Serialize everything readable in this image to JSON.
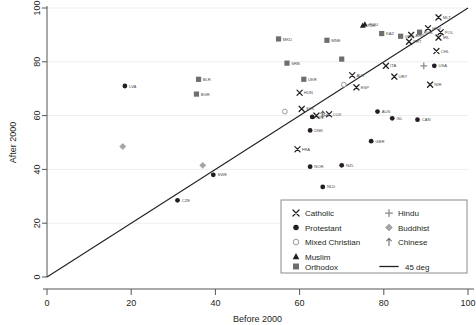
{
  "chart_data": {
    "type": "scatter",
    "title": "",
    "xlabel": "Before 2000",
    "ylabel": "After 2000",
    "xlim": [
      0,
      100
    ],
    "ylim": [
      0,
      100
    ],
    "xticks": [
      0,
      20,
      40,
      60,
      80,
      100
    ],
    "yticks": [
      0,
      20,
      40,
      60,
      80,
      100
    ],
    "grid": true,
    "grid_axis": "y",
    "legend_position": "bottom-right",
    "legend": [
      {
        "key": "catholic",
        "label": "Catholic",
        "marker": "x",
        "color": "#231f20"
      },
      {
        "key": "protestant",
        "label": "Protestant",
        "marker": "filled-circle",
        "color": "#231f20"
      },
      {
        "key": "mixed",
        "label": "Mixed Christian",
        "marker": "open-circle",
        "color": "#999999"
      },
      {
        "key": "muslim",
        "label": "Muslim",
        "marker": "triangle",
        "color": "#231f20"
      },
      {
        "key": "orthodox",
        "label": "Orthodox",
        "marker": "square",
        "color": "#6e6e6e"
      },
      {
        "key": "hindu",
        "label": "Hindu",
        "marker": "plus",
        "color": "#8a8a8a"
      },
      {
        "key": "buddhist",
        "label": "Buddhist",
        "marker": "diamond",
        "color": "#a6a6a6"
      },
      {
        "key": "chinese",
        "label": "Chinese",
        "marker": "arrow-up",
        "color": "#6e6e6e"
      },
      {
        "key": "45deg",
        "label": "45 deg",
        "marker": "line",
        "color": "#231f20"
      }
    ],
    "reference_line": {
      "label": "45 deg",
      "from": [
        0,
        0
      ],
      "to": [
        100,
        100
      ],
      "color": "#231f20"
    },
    "points": [
      {
        "label": "LVA",
        "x": 18.5,
        "y": 71.0,
        "group": "protestant"
      },
      {
        "label": "BLR",
        "x": 36.0,
        "y": 73.5,
        "group": "orthodox"
      },
      {
        "label": "BGR",
        "x": 35.5,
        "y": 68.0,
        "group": "orthodox"
      },
      {
        "label": "",
        "x": 18.0,
        "y": 48.5,
        "group": "buddhist"
      },
      {
        "label": "",
        "x": 37.0,
        "y": 41.5,
        "group": "buddhist"
      },
      {
        "label": "CZE",
        "x": 31.0,
        "y": 28.5,
        "group": "protestant"
      },
      {
        "label": "SWE",
        "x": 39.5,
        "y": 38.0,
        "group": "protestant"
      },
      {
        "label": "MKD",
        "x": 55.0,
        "y": 88.5,
        "group": "orthodox"
      },
      {
        "label": "SRB",
        "x": 57.0,
        "y": 79.5,
        "group": "orthodox"
      },
      {
        "label": "UKR",
        "x": 61.0,
        "y": 73.5,
        "group": "orthodox"
      },
      {
        "label": "MNE",
        "x": 66.5,
        "y": 88.0,
        "group": "orthodox"
      },
      {
        "label": "",
        "x": 70.0,
        "y": 81.0,
        "group": "orthodox"
      },
      {
        "label": "ROU",
        "x": 75.5,
        "y": 94.0,
        "group": "muslim"
      },
      {
        "label": "TUR",
        "x": 75.0,
        "y": 93.5,
        "group": "muslim"
      },
      {
        "label": "KAZ",
        "x": 79.5,
        "y": 90.5,
        "group": "orthodox"
      },
      {
        "label": "GRC",
        "x": 84.0,
        "y": 89.5,
        "group": "orthodox"
      },
      {
        "label": "RUS",
        "x": 88.5,
        "y": 91.0,
        "group": "orthodox"
      },
      {
        "label": "HRV",
        "x": 90.5,
        "y": 92.5,
        "group": "catholic"
      },
      {
        "label": "MLT",
        "x": 93.0,
        "y": 96.5,
        "group": "catholic"
      },
      {
        "label": "IRL",
        "x": 93.0,
        "y": 89.0,
        "group": "catholic"
      },
      {
        "label": "POL",
        "x": 93.5,
        "y": 91.0,
        "group": "catholic"
      },
      {
        "label": "CHL",
        "x": 92.5,
        "y": 84.0,
        "group": "catholic"
      },
      {
        "label": "USA",
        "x": 92.0,
        "y": 78.5,
        "group": "protestant"
      },
      {
        "label": "",
        "x": 89.5,
        "y": 78.5,
        "group": "hindu"
      },
      {
        "label": "PRT",
        "x": 86.0,
        "y": 87.5,
        "group": "catholic"
      },
      {
        "label": "ARG",
        "x": 86.5,
        "y": 90.0,
        "group": "catholic"
      },
      {
        "label": "NIR",
        "x": 91.0,
        "y": 71.5,
        "group": "catholic"
      },
      {
        "label": "ITA",
        "x": 80.5,
        "y": 78.5,
        "group": "catholic"
      },
      {
        "label": "URY",
        "x": 82.5,
        "y": 74.5,
        "group": "catholic"
      },
      {
        "label": "CAN",
        "x": 88.0,
        "y": 58.5,
        "group": "protestant"
      },
      {
        "label": "ISL",
        "x": 82.0,
        "y": 59.0,
        "group": "protestant"
      },
      {
        "label": "AUS",
        "x": 78.5,
        "y": 61.5,
        "group": "protestant"
      },
      {
        "label": "GBR",
        "x": 77.0,
        "y": 50.5,
        "group": "protestant"
      },
      {
        "label": "ESP",
        "x": 73.5,
        "y": 70.5,
        "group": "catholic"
      },
      {
        "label": "AUT",
        "x": 72.5,
        "y": 75.0,
        "group": "catholic"
      },
      {
        "label": "",
        "x": 70.5,
        "y": 71.5,
        "group": "mixed"
      },
      {
        "label": "LUX",
        "x": 67.0,
        "y": 60.5,
        "group": "catholic"
      },
      {
        "label": "",
        "x": 65.5,
        "y": 60.5,
        "group": "chinese"
      },
      {
        "label": "CHE",
        "x": 64.0,
        "y": 60.0,
        "group": "catholic"
      },
      {
        "label": "FIN",
        "x": 63.0,
        "y": 59.5,
        "group": "protestant"
      },
      {
        "label": "DNK",
        "x": 62.5,
        "y": 54.5,
        "group": "protestant"
      },
      {
        "label": "SVK",
        "x": 60.5,
        "y": 62.5,
        "group": "catholic"
      },
      {
        "label": "",
        "x": 56.5,
        "y": 61.5,
        "group": "mixed"
      },
      {
        "label": "HUN",
        "x": 60.0,
        "y": 68.5,
        "group": "catholic"
      },
      {
        "label": "FRA",
        "x": 59.5,
        "y": 47.5,
        "group": "catholic"
      },
      {
        "label": "NOR",
        "x": 62.5,
        "y": 41.0,
        "group": "protestant"
      },
      {
        "label": "NZL",
        "x": 70.0,
        "y": 41.5,
        "group": "protestant"
      },
      {
        "label": "NLD",
        "x": 65.5,
        "y": 33.5,
        "group": "protestant"
      }
    ]
  }
}
